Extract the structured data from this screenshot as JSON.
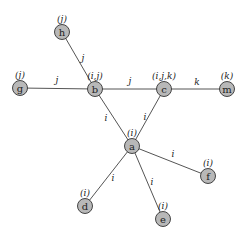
{
  "diagram": {
    "type": "graph",
    "nodes": [
      {
        "id": "h",
        "label": "h",
        "set": "(j)",
        "x": 62,
        "y": 32
      },
      {
        "id": "g",
        "label": "g",
        "set": "(j)",
        "x": 20,
        "y": 88
      },
      {
        "id": "b",
        "label": "b",
        "set": "(i,j)",
        "x": 95,
        "y": 89
      },
      {
        "id": "c",
        "label": "c",
        "set": "(i,j,k)",
        "x": 164,
        "y": 89
      },
      {
        "id": "m",
        "label": "m",
        "set": "(k)",
        "x": 227,
        "y": 89
      },
      {
        "id": "a",
        "label": "a",
        "set": "(i)",
        "x": 132,
        "y": 146
      },
      {
        "id": "f",
        "label": "f",
        "set": "(i)",
        "x": 208,
        "y": 176
      },
      {
        "id": "d",
        "label": "d",
        "set": "(i)",
        "x": 85,
        "y": 206
      },
      {
        "id": "e",
        "label": "e",
        "set": "(i)",
        "x": 163,
        "y": 219
      }
    ],
    "edges": [
      {
        "from": "h",
        "to": "b",
        "label": "j",
        "lx": 83,
        "ly": 61
      },
      {
        "from": "g",
        "to": "b",
        "label": "j",
        "lx": 57,
        "ly": 83
      },
      {
        "from": "b",
        "to": "c",
        "label": "j",
        "lx": 130,
        "ly": 84
      },
      {
        "from": "c",
        "to": "m",
        "label": "k",
        "lx": 197,
        "ly": 85
      },
      {
        "from": "b",
        "to": "a",
        "label": "i",
        "lx": 106,
        "ly": 121
      },
      {
        "from": "c",
        "to": "a",
        "label": "i",
        "lx": 145,
        "ly": 120
      },
      {
        "from": "a",
        "to": "f",
        "label": "i",
        "lx": 173,
        "ly": 157
      },
      {
        "from": "a",
        "to": "d",
        "label": "i",
        "lx": 113,
        "ly": 181
      },
      {
        "from": "a",
        "to": "e",
        "label": "i",
        "lx": 152,
        "ly": 185
      }
    ]
  }
}
